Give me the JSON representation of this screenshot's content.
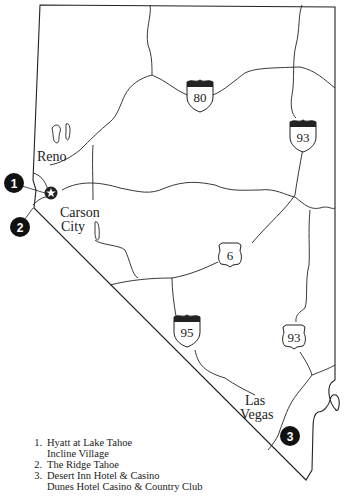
{
  "map": {
    "region": "Nevada",
    "cities": [
      {
        "name": "Reno",
        "x": 37,
        "y": 161
      },
      {
        "name": "Carson",
        "x": 60,
        "y": 217
      },
      {
        "name": "City",
        "x": 61,
        "y": 231
      },
      {
        "name": "Las",
        "x": 245,
        "y": 405
      },
      {
        "name": "Vegas",
        "x": 240,
        "y": 419
      }
    ],
    "highways": [
      {
        "type": "interstate",
        "number": "80",
        "x": 200,
        "y": 95
      },
      {
        "type": "interstate",
        "number": "93",
        "x": 303,
        "y": 135
      },
      {
        "type": "us",
        "number": "6",
        "x": 230,
        "y": 255
      },
      {
        "type": "interstate",
        "number": "95",
        "x": 187,
        "y": 330
      },
      {
        "type": "us",
        "number": "93",
        "x": 294,
        "y": 337
      }
    ],
    "markers": [
      {
        "number": "1",
        "x": 14,
        "y": 183
      },
      {
        "number": "2",
        "x": 20,
        "y": 227
      },
      {
        "number": "3",
        "x": 290,
        "y": 436
      }
    ],
    "capital_icon": "star-icon"
  },
  "legend": {
    "items": [
      {
        "number": "1.",
        "label": "Hyatt at Lake Tahoe",
        "sublabel": "Incline Village"
      },
      {
        "number": "2.",
        "label": "The Ridge Tahoe"
      },
      {
        "number": "3.",
        "label": "Desert Inn Hotel & Casino"
      },
      {
        "number": "",
        "label": "Dunes Hotel Casino & Country Club"
      }
    ]
  }
}
